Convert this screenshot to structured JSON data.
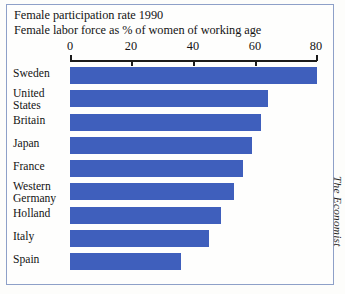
{
  "titles": [
    "Female participation rate 1990",
    "Female labor force as % of women of working age"
  ],
  "credit": "The Economist",
  "colors": {
    "bar": "#3f5fbc",
    "frame": "#8ea0c8",
    "axis": "#1b1b1b",
    "background": "#fefefd"
  },
  "axis": {
    "ticks": [
      "0",
      "20",
      "40",
      "60",
      "80"
    ],
    "tick_values": [
      0,
      20,
      40,
      60,
      80
    ],
    "min": 0,
    "max": 80,
    "pixel_start": 70,
    "pixel_end": 317
  },
  "rows": [
    {
      "label": [
        "Sweden"
      ],
      "value": 80
    },
    {
      "label": [
        "United",
        "States"
      ],
      "value": 64
    },
    {
      "label": [
        "Britain"
      ],
      "value": 62
    },
    {
      "label": [
        "Japan"
      ],
      "value": 59
    },
    {
      "label": [
        "France"
      ],
      "value": 56
    },
    {
      "label": [
        "Western",
        "Germany"
      ],
      "value": 53
    },
    {
      "label": [
        "Holland"
      ],
      "value": 49
    },
    {
      "label": [
        "Italy"
      ],
      "value": 45
    },
    {
      "label": [
        "Spain"
      ],
      "value": 36
    }
  ],
  "chart_data": {
    "type": "bar",
    "orientation": "horizontal",
    "title": "Female participation rate 1990",
    "subtitle": "Female labor force as % of women of working age",
    "xlabel": "",
    "ylabel": "",
    "xlim": [
      0,
      80
    ],
    "grid": false,
    "legend": null,
    "annotations": [
      "The Economist"
    ],
    "categories": [
      "Sweden",
      "United States",
      "Britain",
      "Japan",
      "France",
      "Western Germany",
      "Holland",
      "Italy",
      "Spain"
    ],
    "values": [
      80,
      64,
      62,
      59,
      56,
      53,
      49,
      45,
      36
    ],
    "tick_labels": [
      "0",
      "20",
      "40",
      "60",
      "80"
    ]
  }
}
